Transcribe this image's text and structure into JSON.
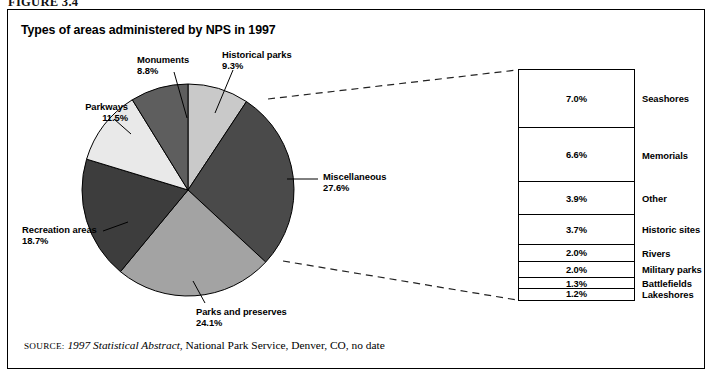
{
  "figure": {
    "label": "FIGURE 3.4",
    "title": "Types of areas administered by NPS in 1997"
  },
  "source": {
    "prefix": "SOURCE:",
    "italic_title": "1997 Statistical Abstract",
    "rest": ", National Park Service, Denver, CO, no date"
  },
  "colors": {
    "historical_parks": "#c9c9c9",
    "miscellaneous": "#4a4a4a",
    "parks_and_preserves": "#a3a3a3",
    "recreation_areas": "#3d3d3d",
    "parkways": "#e9e9e9",
    "monuments": "#5e5e5e",
    "outline": "#000000",
    "frame": "#000000",
    "background": "#ffffff"
  },
  "chart_data": {
    "type": "pie",
    "title": "Types of areas administered by NPS in 1997",
    "xlabel": "",
    "ylabel": "",
    "unit": "%",
    "start_angle_deg": 0,
    "direction": "clockwise",
    "categories": [
      "Historical parks",
      "Miscellaneous",
      "Parks and preserves",
      "Recreation areas",
      "Parkways",
      "Monuments"
    ],
    "values": [
      9.3,
      27.6,
      24.1,
      18.7,
      11.5,
      8.8
    ],
    "labels": [
      {
        "name": "Historical parks",
        "pct": "9.3%",
        "value": 9.3
      },
      {
        "name": "Miscellaneous",
        "pct": "27.6%",
        "value": 27.6
      },
      {
        "name": "Parks and preserves",
        "pct": "24.1%",
        "value": 24.1
      },
      {
        "name": "Recreation areas",
        "pct": "18.7%",
        "value": 18.7
      },
      {
        "name": "Parkways",
        "pct": "11.5%",
        "value": 11.5
      },
      {
        "name": "Monuments",
        "pct": "8.8%",
        "value": 8.8
      }
    ],
    "breakout": {
      "of_slice": "Miscellaneous",
      "of_slice_total": 27.6,
      "type": "table",
      "columns": [
        "Percent",
        "Category"
      ],
      "rows": [
        {
          "pct": "7.0%",
          "value": 7.0,
          "label": "Seashores"
        },
        {
          "pct": "6.6%",
          "value": 6.6,
          "label": "Memorials"
        },
        {
          "pct": "3.9%",
          "value": 3.9,
          "label": "Other"
        },
        {
          "pct": "3.7%",
          "value": 3.7,
          "label": "Historic sites"
        },
        {
          "pct": "2.0%",
          "value": 2.0,
          "label": "Rivers"
        },
        {
          "pct": "2.0%",
          "value": 2.0,
          "label": "Military parks"
        },
        {
          "pct": "1.3%",
          "value": 1.3,
          "label": "Battlefields"
        },
        {
          "pct": "1.2%",
          "value": 1.2,
          "label": "Lakeshores"
        }
      ]
    },
    "legend_position": "callouts",
    "grid": false
  }
}
